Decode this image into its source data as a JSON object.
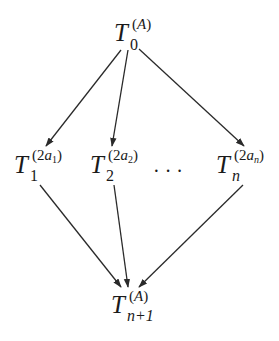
{
  "diagram": {
    "type": "directed-graph",
    "nodes": [
      {
        "id": "top",
        "base": "T",
        "subscript": "0",
        "superscript_open": "(",
        "superscript_var": "A",
        "superscript_close": ")"
      },
      {
        "id": "mid1",
        "base": "T",
        "subscript": "1",
        "superscript_open": "(2",
        "superscript_var": "a",
        "superscript_index": "1",
        "superscript_close": ")"
      },
      {
        "id": "mid2",
        "base": "T",
        "subscript": "2",
        "superscript_open": "(2",
        "superscript_var": "a",
        "superscript_index": "2",
        "superscript_close": ")"
      },
      {
        "id": "midn",
        "base": "T",
        "subscript": "n",
        "superscript_open": "(2",
        "superscript_var": "a",
        "superscript_index": "n",
        "superscript_close": ")"
      },
      {
        "id": "bottom",
        "base": "T",
        "subscript": "n+1",
        "superscript_open": "(",
        "superscript_var": "A",
        "superscript_close": ")"
      }
    ],
    "ellipsis": "···",
    "edges": [
      {
        "from": "top",
        "to": "mid1"
      },
      {
        "from": "top",
        "to": "mid2"
      },
      {
        "from": "top",
        "to": "midn"
      },
      {
        "from": "mid1",
        "to": "bottom"
      },
      {
        "from": "mid2",
        "to": "bottom"
      },
      {
        "from": "midn",
        "to": "bottom"
      }
    ],
    "edge_color": "#2a2a2a"
  }
}
